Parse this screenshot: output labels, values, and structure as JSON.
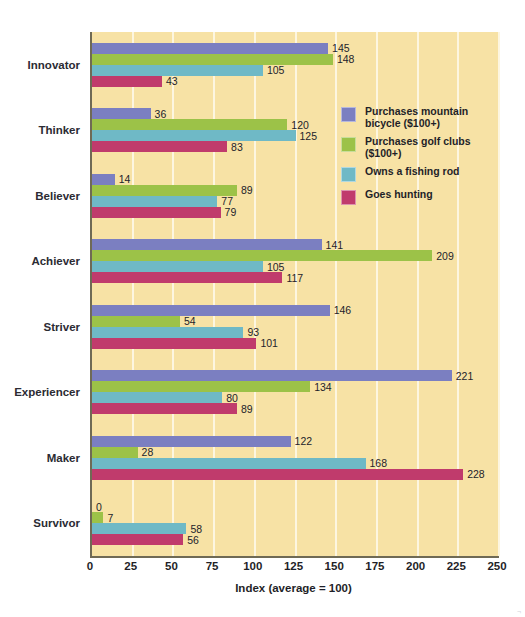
{
  "page_header": "",
  "chart_data": {
    "type": "bar",
    "orientation": "horizontal",
    "title": "",
    "xlabel": "Index (average = 100)",
    "ylabel": "",
    "xlim": [
      0,
      250
    ],
    "xticks": [
      0,
      25,
      50,
      75,
      100,
      125,
      150,
      175,
      200,
      225,
      250
    ],
    "grid": true,
    "grid_axis": "x",
    "legend_position": "inside-right",
    "categories": [
      "Innovator",
      "Thinker",
      "Believer",
      "Achiever",
      "Striver",
      "Experiencer",
      "Maker",
      "Survivor"
    ],
    "series": [
      {
        "name": "Purchases mountain bicycle ($100+)",
        "color": "#7b7fc1",
        "values": [
          145,
          36,
          14,
          141,
          146,
          221,
          122,
          0
        ]
      },
      {
        "name": "Purchases golf clubs ($100+)",
        "color": "#9cc248",
        "values": [
          148,
          120,
          89,
          209,
          54,
          134,
          28,
          7
        ]
      },
      {
        "name": "Owns a fishing rod",
        "color": "#6fb9c6",
        "values": [
          105,
          125,
          77,
          105,
          93,
          80,
          168,
          58
        ]
      },
      {
        "name": "Goes hunting",
        "color": "#c03b6c",
        "values": [
          43,
          83,
          79,
          117,
          101,
          89,
          228,
          56
        ]
      }
    ]
  },
  "legend": {
    "items": [
      {
        "label": "Purchases mountain bicycle ($100+)",
        "color": "#7b7fc1"
      },
      {
        "label": "Purchases golf clubs ($100+)",
        "color": "#9cc248"
      },
      {
        "label": "Owns a fishing rod",
        "color": "#6fb9c6"
      },
      {
        "label": "Goes hunting",
        "color": "#c03b6c"
      }
    ]
  },
  "colors": {
    "plot_background": "#f7e2a5",
    "gridline": "#fdf6e0",
    "axis": "#6f6a55",
    "page_background": "#ffffff",
    "text": "#1f1f28"
  }
}
